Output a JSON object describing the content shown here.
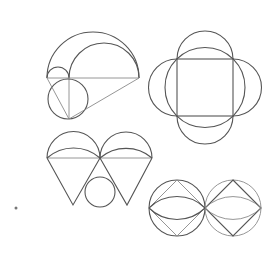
{
  "diagram": {
    "stroke_color": "#555555",
    "light_stroke_color": "#8a8a8a",
    "background": "#ffffff",
    "figures": [
      {
        "id": "semicircle-arbelos",
        "label": "Nested semicircles with inscribed circle and triangle"
      },
      {
        "id": "square-quatrefoil",
        "label": "Square with circumcircle and four side semicircles"
      },
      {
        "id": "twin-cones",
        "label": "Two semicircles atop triangles with inscribed circle"
      },
      {
        "id": "twin-circles-diamonds",
        "label": "Two tangent circles with inscribed diamonds and lens arcs"
      }
    ],
    "dot": {
      "x": 16,
      "y": 208
    }
  }
}
